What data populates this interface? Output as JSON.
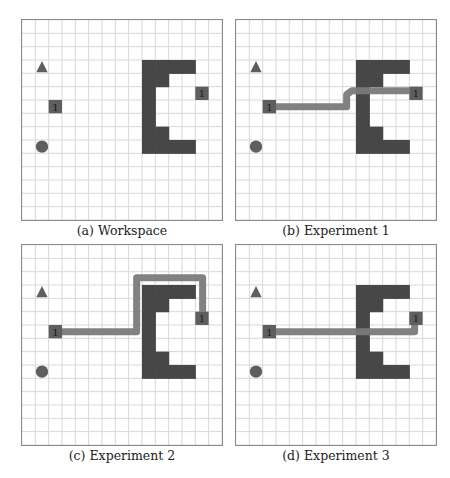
{
  "figure": {
    "grid": {
      "cols": 15,
      "rows": 15,
      "cell_px": 13.33
    },
    "colors": {
      "background": "#ffffff",
      "grid_line": "#d8d8d8",
      "border": "#8a8a8a",
      "obstacle": "#474747",
      "marker": "#5e5e5e",
      "path": "#7a7a7a",
      "label_text": "#1a1a1a"
    },
    "obstacle_cells": [
      [
        9,
        3
      ],
      [
        10,
        3
      ],
      [
        11,
        3
      ],
      [
        12,
        3
      ],
      [
        9,
        4
      ],
      [
        10,
        4
      ],
      [
        9,
        5
      ],
      [
        9,
        6
      ],
      [
        9,
        7
      ],
      [
        9,
        8
      ],
      [
        10,
        8
      ],
      [
        9,
        9
      ],
      [
        10,
        9
      ],
      [
        11,
        9
      ],
      [
        12,
        9
      ]
    ],
    "markers": {
      "triangle": {
        "col": 1,
        "row": 3
      },
      "circle": {
        "col": 1,
        "row": 9
      },
      "start_square": {
        "col": 2,
        "row": 6,
        "label": "1"
      },
      "goal_square": {
        "col": 13,
        "row": 5,
        "label": "1"
      }
    },
    "panels": [
      {
        "id": "a",
        "caption": "(a) Workspace",
        "path": []
      },
      {
        "id": "b",
        "caption": "(b) Experiment 1",
        "path": [
          [
            3.0,
            6.5
          ],
          [
            8.3,
            6.5
          ],
          [
            8.3,
            5.6
          ],
          [
            8.7,
            5.3
          ],
          [
            13.0,
            5.3
          ]
        ]
      },
      {
        "id": "c",
        "caption": "(c) Experiment 2",
        "path": [
          [
            3.0,
            6.5
          ],
          [
            8.6,
            6.5
          ],
          [
            8.6,
            2.45
          ],
          [
            13.55,
            2.45
          ],
          [
            13.55,
            5.0
          ]
        ]
      },
      {
        "id": "d",
        "caption": "(d) Experiment 3",
        "path": [
          [
            3.0,
            6.5
          ],
          [
            13.4,
            6.5
          ],
          [
            13.4,
            5.8
          ]
        ]
      }
    ]
  }
}
